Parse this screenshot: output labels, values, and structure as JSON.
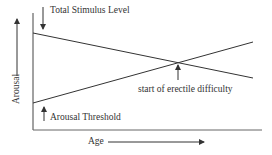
{
  "diagram": {
    "type": "line-diagram",
    "labels": {
      "total_stimulus": "Total Stimulus Level",
      "arousal_threshold": "Arousal Threshold",
      "intersection": "start of erectile difficulty",
      "x_axis": "Age",
      "y_axis": "Arousal"
    },
    "lines": [
      {
        "name": "Total Stimulus Level",
        "trend": "decreasing",
        "start": [
          33,
          33
        ],
        "end": [
          253,
          78
        ]
      },
      {
        "name": "Arousal Threshold",
        "trend": "increasing",
        "start": [
          33,
          103
        ],
        "end": [
          253,
          42
        ]
      }
    ],
    "colors": {
      "line": "#333333",
      "background": "#ffffff"
    }
  }
}
